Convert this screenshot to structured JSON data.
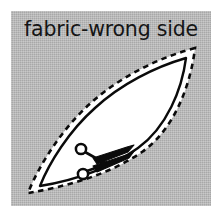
{
  "figure": {
    "title": "fabric-wrong side",
    "kind": "sewing-pattern-diagram",
    "background_color": "#b5b5b5",
    "panel_border_color": "#ffffff",
    "ink_color": "#000000",
    "piece_fill_color": "#ffffff",
    "elements": [
      {
        "name": "fabric-panel",
        "label": "fabric-wrong side"
      },
      {
        "name": "cutting-line",
        "label": "dashed cutting line"
      },
      {
        "name": "stitching-line",
        "label": "solid stitching line"
      },
      {
        "name": "pattern-piece",
        "label": "leaf-shaped pattern piece"
      },
      {
        "name": "scissors",
        "label": "scissors"
      }
    ],
    "geometry": {
      "panel": {
        "x": 11,
        "y": 11,
        "width": 200,
        "height": 195
      },
      "leaf_top_tip": [
        184,
        37
      ],
      "leaf_bottom_tip": [
        17,
        182
      ],
      "scissors_anchor": [
        95,
        148
      ]
    }
  }
}
